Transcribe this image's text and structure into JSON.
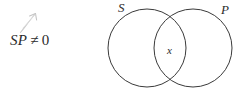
{
  "figure": {
    "type": "venn-diagram",
    "caption_expression": {
      "left_term": "SP",
      "relation": "≠",
      "right_term": "0",
      "full_text": "SP ≠ 0"
    },
    "annotation": {
      "name": "pencil-arrow",
      "description": "faint hand-drawn gray arrow pointing up-right toward the expression",
      "color": "#c9c9c9"
    },
    "venn": {
      "left_circle": {
        "label": "S",
        "center_x": 44,
        "center_y": 48,
        "radius": 39
      },
      "right_circle": {
        "label": "P",
        "center_x": 90,
        "center_y": 48,
        "radius": 39
      },
      "intersection_mark": "x",
      "stroke_color": "#3a3a3a",
      "stroke_width": 1,
      "fill": "none"
    }
  },
  "colors": {
    "background": "#ffffff",
    "ink": "#2b2b2b",
    "stroke": "#3a3a3a",
    "pencil": "#c9c9c9"
  }
}
